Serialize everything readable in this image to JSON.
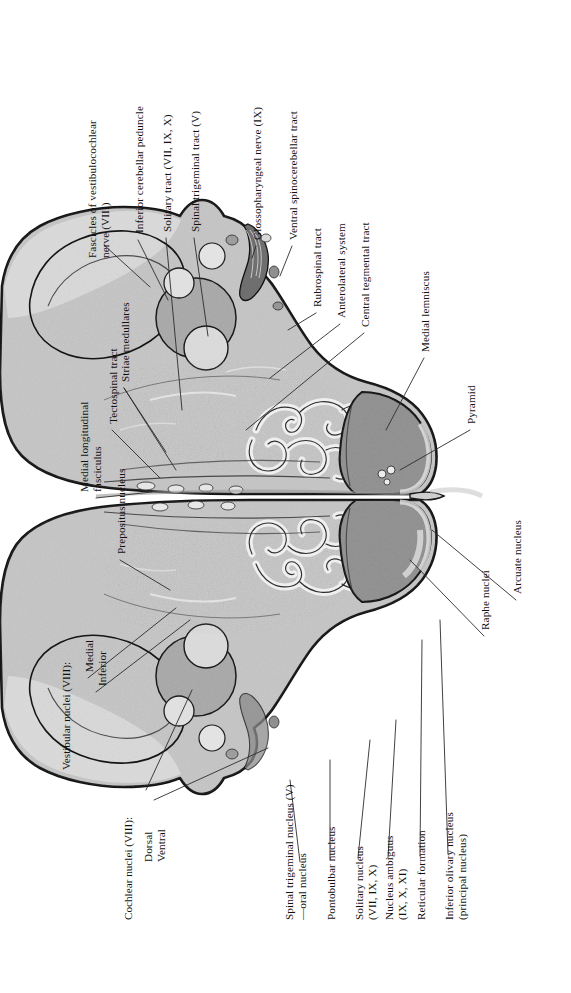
{
  "plate": {
    "title": "Rostral medulla oblongata — transverse section",
    "orientation": "labels rotated 90 degrees counter-clockwise",
    "colors": {
      "ink": "#111111",
      "leader": "#2b2b2b",
      "outline": "#1a1a1a",
      "tissue_light": "#c9c9c9",
      "tissue_mid": "#b0b0b0",
      "tissue_dark": "#9a9a9a",
      "nucleus_dark": "#8d8d8d",
      "pale": "#e2e2e2",
      "background": "#ffffff"
    }
  },
  "labels": {
    "top_left_column": [
      {
        "id": "fascicles-vestibulocochlear",
        "line1": "Fascicles of vestibulocochlear",
        "line2": "nerve (VIII)"
      },
      {
        "id": "inferior-cerebellar-peduncle",
        "line1": "Inferior cerebellar peduncle",
        "line2": ""
      },
      {
        "id": "solitary-tract",
        "line1": "Solitary tract (VII, IX, X)",
        "line2": ""
      },
      {
        "id": "spinal-trigeminal-tract",
        "line1": "Spinal trigeminal tract (V)",
        "line2": ""
      },
      {
        "id": "glossopharyngeal-nerve",
        "line1": "Glossopharyngeal nerve (IX)",
        "line2": ""
      }
    ],
    "top_right_column": [
      {
        "id": "ventral-spinocerebellar-tract",
        "line1": "Ventral spinocerebellar tract",
        "line2": ""
      },
      {
        "id": "rubrospinal-tract",
        "line1": "Rubrospinal tract",
        "line2": ""
      },
      {
        "id": "anterolateral-system",
        "line1": "Anterolateral system",
        "line2": ""
      },
      {
        "id": "central-tegmental-tract",
        "line1": "Central tegmental tract",
        "line2": ""
      },
      {
        "id": "medial-lemniscus",
        "line1": "Medial lemniscus",
        "line2": ""
      },
      {
        "id": "pyramid",
        "line1": "Pyramid",
        "line2": ""
      }
    ],
    "left_column": [
      {
        "id": "striae-medullares",
        "line1": "Striae medullares",
        "line2": ""
      },
      {
        "id": "tectospinal-tract",
        "line1": "Tectospinal tract",
        "line2": ""
      },
      {
        "id": "medial-longitudinal-fasciculus",
        "line1": "Medial longitudinal",
        "line2": "fasciculus"
      },
      {
        "id": "prepositus-nucleus",
        "line1": "Prepositus nucleus",
        "line2": ""
      }
    ],
    "groups": [
      {
        "id": "vestibular-nuclei",
        "heading": "Vestibular nuclei (VIII):",
        "items": [
          "Medial",
          "Inferior"
        ]
      },
      {
        "id": "cochlear-nuclei",
        "heading": "Cochlear nuclei (VIII):",
        "items": [
          "Dorsal",
          "Ventral"
        ]
      }
    ],
    "bottom_column": [
      {
        "id": "spinal-trigeminal-nucleus",
        "line1": "Spinal trigeminal nucleus (V)",
        "line2": "—oral nucleus"
      },
      {
        "id": "pontobulbar-nucleus",
        "line1": "Pontobulbar nucleus",
        "line2": ""
      },
      {
        "id": "solitary-nucleus",
        "line1": "Solitary nucleus",
        "line2": "(VII, IX, X)"
      },
      {
        "id": "nucleus-ambiguus",
        "line1": "Nucleus ambiguus",
        "line2": "(IX, X, XI)"
      },
      {
        "id": "reticular-formation",
        "line1": "Reticular formation",
        "line2": ""
      },
      {
        "id": "inferior-olivary-nucleus",
        "line1": "Inferior olivary nucleus",
        "line2": "(principal nucleus)"
      }
    ],
    "right_lower_column": [
      {
        "id": "arcuate-nucleus",
        "line1": "Arcuate nucleus",
        "line2": ""
      },
      {
        "id": "raphe-nuclei",
        "line1": "Raphe nuclei",
        "line2": ""
      }
    ]
  }
}
